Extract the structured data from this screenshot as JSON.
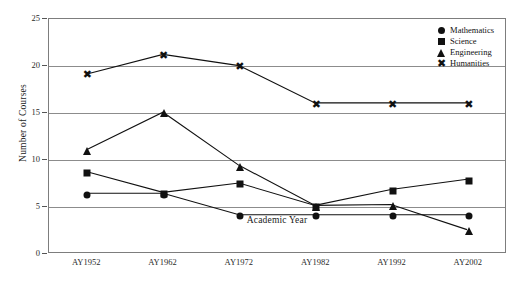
{
  "chart_data": {
    "type": "line",
    "title": "",
    "xlabel": "Academic Year",
    "ylabel": "Number of Courses",
    "categories": [
      "AY1952",
      "AY1962",
      "AY1972",
      "AY1982",
      "AY1992",
      "AY2002"
    ],
    "ylim": [
      0,
      25
    ],
    "yticks": [
      0,
      5,
      10,
      15,
      20,
      25
    ],
    "grid": "horizontal",
    "legend_position": "top-right-inside",
    "series": [
      {
        "name": "Mathematics",
        "marker": "circle",
        "values": [
          6.3,
          6.3,
          4.0,
          4.0,
          4.0,
          4.0
        ]
      },
      {
        "name": "Science",
        "marker": "square",
        "values": [
          8.6,
          6.4,
          7.4,
          5.0,
          6.7,
          7.8
        ]
      },
      {
        "name": "Engineering",
        "marker": "triangle",
        "values": [
          11.0,
          15.0,
          9.3,
          5.0,
          5.1,
          2.4
        ]
      },
      {
        "name": "Humanities",
        "marker": "cross",
        "values": [
          19.1,
          21.2,
          20.0,
          16.0,
          16.0,
          16.0
        ]
      }
    ],
    "colors": {
      "series": "#111111",
      "gridline": "#8c8c8c",
      "frame": "#7d7d7d",
      "text": "#1a1a1a",
      "background": "#ffffff"
    }
  },
  "legend": {
    "items": [
      {
        "label": "Mathematics",
        "icon": "circle-marker-icon"
      },
      {
        "label": "Science",
        "icon": "square-marker-icon"
      },
      {
        "label": "Engineering",
        "icon": "triangle-marker-icon"
      },
      {
        "label": "Humanities",
        "icon": "cross-marker-icon"
      }
    ]
  },
  "axes": {
    "y_title": "Number of Courses",
    "x_title": "Academic Year",
    "y_ticks": [
      "25",
      "20",
      "15",
      "10",
      "5",
      "0"
    ],
    "x_ticks": [
      "AY1952",
      "AY1962",
      "AY1972",
      "AY1982",
      "AY1992",
      "AY2002"
    ]
  }
}
